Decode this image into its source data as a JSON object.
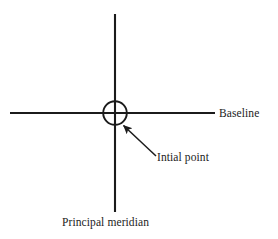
{
  "figure": {
    "background_color": "#ffffff",
    "stroke_color": "#1b1b1b",
    "labels": {
      "baseline": "Baseline",
      "initial_point": "Intial point",
      "principal_meridian": "Principal meridian"
    },
    "geometry": {
      "baseline_axis": {
        "name": "baseline-horizontal-line",
        "x1": 10,
        "y1": 113,
        "x2": 215,
        "y2": 113
      },
      "meridian_axis": {
        "name": "principal-meridian-vertical-line",
        "x1": 115,
        "y1": 14,
        "x2": 115,
        "y2": 212
      },
      "initial_point_circle": {
        "name": "initial-point-circle",
        "cx": 115,
        "cy": 113,
        "r": 12
      },
      "leader_arrow": {
        "name": "initial-point-leader-arrow",
        "tail_x": 156,
        "tail_y": 156,
        "tip_x": 122,
        "tip_y": 124
      }
    }
  }
}
